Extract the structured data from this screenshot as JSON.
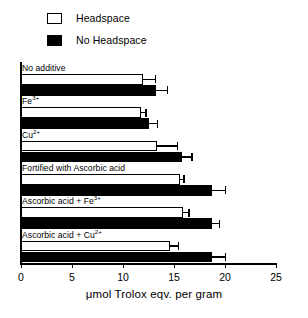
{
  "chart_data": {
    "type": "bar",
    "orientation": "horizontal",
    "title": "",
    "xlabel": "μmol Trolox eqv. per gram",
    "ylabel": "",
    "xlim": [
      0,
      25
    ],
    "xticks": [
      0,
      5,
      10,
      15,
      20,
      25
    ],
    "xticklabels": [
      "0",
      "5",
      "10",
      "15",
      "20",
      "25"
    ],
    "grid": false,
    "legend_position": "top-left",
    "categories": [
      "No additive",
      "Fe3+",
      "Cu2+",
      "Fortified with Ascorbic acid",
      "Ascorbic acid + Fe3+",
      "Ascorbic acid + Cu2+"
    ],
    "series": [
      {
        "name": "Headspace",
        "color": "#ffffff",
        "edgecolor": "#000000",
        "values": [
          12.0,
          11.8,
          13.3,
          15.6,
          15.9,
          14.6
        ],
        "errors": [
          1.1,
          0.4,
          2.0,
          0.3,
          0.5,
          0.8
        ]
      },
      {
        "name": "No Headspace",
        "color": "#000000",
        "edgecolor": "#000000",
        "values": [
          13.2,
          12.5,
          15.8,
          18.7,
          18.7,
          18.7
        ],
        "errors": [
          1.1,
          0.8,
          0.9,
          1.3,
          0.7,
          1.3
        ]
      }
    ]
  },
  "legend": {
    "items": [
      {
        "label": "Headspace",
        "style": "open"
      },
      {
        "label": "No Headspace",
        "style": "filled"
      }
    ]
  },
  "category_labels": [
    {
      "text": "No additive",
      "base": "No additive",
      "sup": ""
    },
    {
      "text": "Fe3+",
      "base": "Fe",
      "sup": "3+"
    },
    {
      "text": "Cu2+",
      "base": "Cu",
      "sup": "2+"
    },
    {
      "text": "Fortified with Ascorbic acid",
      "base": "Fortified with Ascorbic acid",
      "sup": ""
    },
    {
      "text": "Ascorbic acid + Fe3+",
      "base": "Ascorbic acid + Fe",
      "sup": "3+"
    },
    {
      "text": "Ascorbic acid + Cu2+",
      "base": "Ascorbic acid + Cu",
      "sup": "2+"
    }
  ],
  "axis": {
    "x_title": "μmol Trolox eqv. per gram",
    "tick_labels": [
      "0",
      "5",
      "10",
      "15",
      "20",
      "25"
    ]
  }
}
